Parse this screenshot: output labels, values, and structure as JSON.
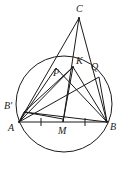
{
  "figure": {
    "kind": "geometry-diagram",
    "stroke_color": "#1a1a1a",
    "background_color": "#ffffff",
    "label_color": "#1a1a1a"
  },
  "labels": [
    {
      "id": "C",
      "text": "C",
      "x": 80,
      "y": 5,
      "align": "center"
    },
    {
      "id": "K",
      "text": "K",
      "x": 77,
      "y": 58,
      "align": "left"
    },
    {
      "id": "Q",
      "text": "Q",
      "x": 92,
      "y": 63,
      "align": "left"
    },
    {
      "id": "P",
      "text": "P",
      "x": 54,
      "y": 68,
      "align": "left"
    },
    {
      "id": "Bp",
      "text": "B'",
      "x": 6,
      "y": 101,
      "align": "left"
    },
    {
      "id": "A",
      "text": "A",
      "x": 10,
      "y": 124,
      "align": "left"
    },
    {
      "id": "M",
      "text": "M",
      "x": 59,
      "y": 126,
      "align": "left"
    },
    {
      "id": "B",
      "text": "B",
      "x": 110,
      "y": 123,
      "align": "left"
    }
  ],
  "points": {
    "A": {
      "x": 19,
      "y": 122
    },
    "B": {
      "x": 107,
      "y": 122
    },
    "C": {
      "x": 79,
      "y": 18
    },
    "M": {
      "x": 63,
      "y": 122
    },
    "K": {
      "x": 73,
      "y": 67
    },
    "P": {
      "x": 56,
      "y": 68
    },
    "Q": {
      "x": 99,
      "y": 77
    },
    "Bp": {
      "x": 24,
      "y": 112
    }
  },
  "circle": {
    "cx": 64,
    "cy": 104,
    "r": 48
  },
  "segments": [
    {
      "name": "A-B",
      "from": "A",
      "to": "B"
    },
    {
      "name": "A-C",
      "from": "A",
      "to": "C"
    },
    {
      "name": "B-C",
      "from": "B",
      "to": "C"
    },
    {
      "name": "C-M",
      "from": "C",
      "to": "M"
    },
    {
      "name": "A-K",
      "from": "A",
      "to": "K"
    },
    {
      "name": "A-P",
      "from": "A",
      "to": "P"
    },
    {
      "name": "A-Q",
      "from": "A",
      "to": "Q"
    },
    {
      "name": "K-B",
      "from": "K",
      "to": "B"
    },
    {
      "name": "K-M",
      "from": "K",
      "to": "M"
    },
    {
      "name": "P-B",
      "from": "P",
      "to": "B"
    },
    {
      "name": "A-Bp",
      "from": "A",
      "to": "Bp"
    },
    {
      "name": "Bp-B",
      "from": "Bp",
      "to": "B"
    },
    {
      "name": "Bp-K",
      "from": "Bp",
      "to": "K"
    },
    {
      "name": "Bp-M",
      "from": "Bp",
      "to": "M"
    },
    {
      "name": "Q-B",
      "from": "Q",
      "to": "B"
    }
  ],
  "tick_marks": [
    {
      "name": "tick-AM",
      "x": 41,
      "y": 122
    },
    {
      "name": "tick-MB",
      "x": 85,
      "y": 122
    }
  ]
}
